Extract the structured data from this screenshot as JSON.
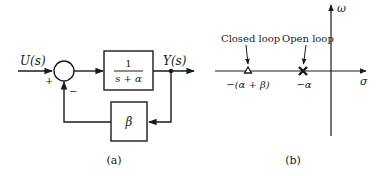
{
  "panel_a": {
    "input_label": "U(s)",
    "output_label": "Y(s)",
    "plus_sign": "+",
    "minus_sign": "−",
    "forward_block": {
      "numerator": "1",
      "denominator": "s + α"
    },
    "feedback_block": "β",
    "caption": "(a)"
  },
  "panel_b": {
    "vertical_axis_label": "ω",
    "horizontal_axis_label": "σ",
    "closed_loop_label": "Closed loop",
    "open_loop_label": "Open loop",
    "closed_loop_pole": "−(α + β)",
    "open_loop_pole": "−α",
    "caption": "(b)"
  }
}
